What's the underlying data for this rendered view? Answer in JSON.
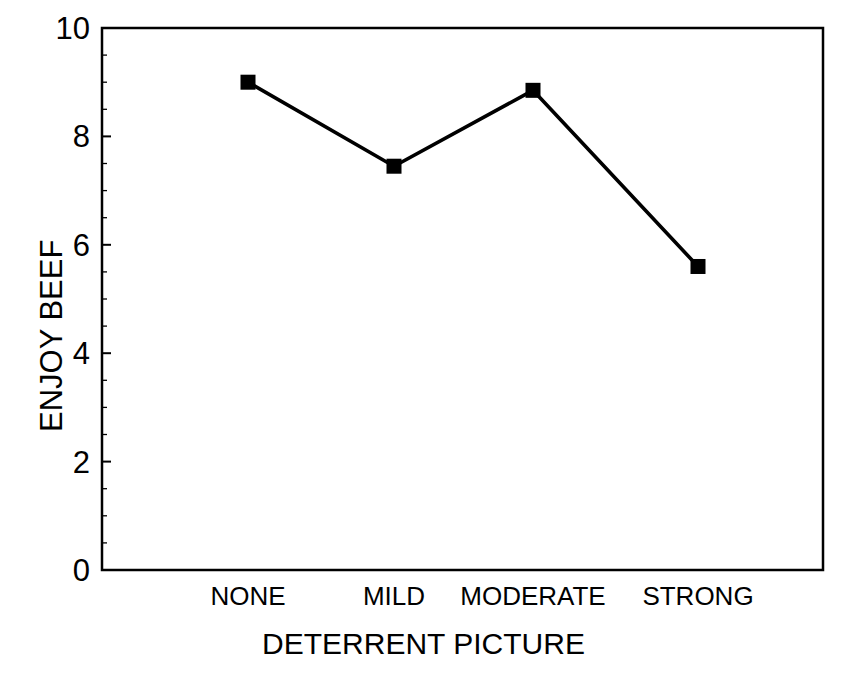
{
  "chart_data": {
    "type": "line",
    "title": "",
    "subtitle": "",
    "xlabel": "DETERRENT PICTURE",
    "ylabel": "ENJOY BEEF",
    "categories": [
      "NONE",
      "MILD",
      "MODERATE",
      "STRONG"
    ],
    "values": [
      9.0,
      7.45,
      8.85,
      5.6
    ],
    "series": [
      {
        "name": "ENJOY BEEF",
        "values": [
          9.0,
          7.45,
          8.85,
          5.6
        ]
      }
    ],
    "ylim": [
      0,
      10
    ],
    "y_ticks": [
      "0",
      "2",
      "4",
      "6",
      "8",
      "10"
    ],
    "y_tick_values": [
      0,
      2,
      4,
      6,
      8,
      10
    ],
    "y_minor_tick_step": 0.5,
    "x_tick_labels": [
      "NONE",
      "MILD",
      "MODERATE",
      "STRONG"
    ],
    "grid": false,
    "legend": false,
    "legend_position": "none",
    "marker": "filled-square",
    "line_color": "#000000",
    "marker_color": "#000000",
    "axis_color": "#000000",
    "background_color": "#ffffff"
  },
  "axes": {
    "y_ticks": [
      {
        "label": "10",
        "value": 10
      },
      {
        "label": "8",
        "value": 8
      },
      {
        "label": "6",
        "value": 6
      },
      {
        "label": "4",
        "value": 4
      },
      {
        "label": "2",
        "value": 2
      },
      {
        "label": "0",
        "value": 0
      }
    ],
    "x_ticks": [
      {
        "label": "NONE"
      },
      {
        "label": "MILD"
      },
      {
        "label": "MODERATE"
      },
      {
        "label": "STRONG"
      }
    ]
  },
  "labels": {
    "y_axis_title": "ENJOY BEEF",
    "x_axis_title": "DETERRENT PICTURE"
  }
}
